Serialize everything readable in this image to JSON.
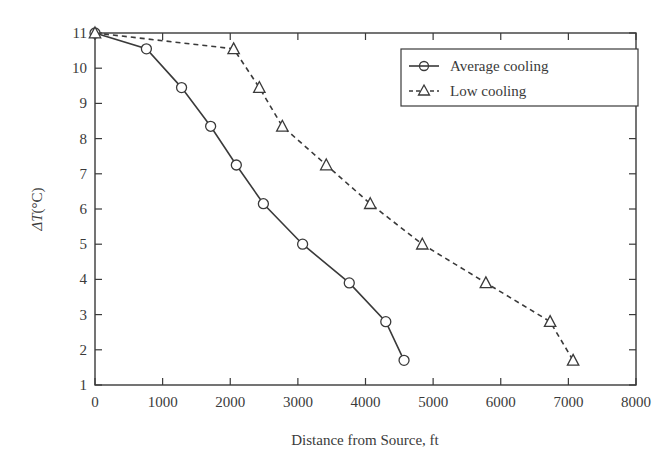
{
  "chart_data": {
    "type": "line",
    "title": "",
    "xlabel": "Distance from Source, ft",
    "ylabel": "ΔT(°C)",
    "xlim": [
      0,
      8000
    ],
    "ylim": [
      1,
      11
    ],
    "xticks": [
      0,
      1000,
      2000,
      3000,
      4000,
      5000,
      6000,
      7000,
      8000
    ],
    "yticks": [
      1,
      2,
      3,
      4,
      5,
      6,
      7,
      8,
      9,
      10,
      11
    ],
    "grid": false,
    "legend_position": "upper right",
    "series": [
      {
        "name": "Average cooling",
        "line_style": "solid",
        "marker": "circle",
        "color": "#3a3a3a",
        "x": [
          0,
          760,
          1280,
          1710,
          2090,
          2490,
          3070,
          3760,
          4300,
          4570
        ],
        "y": [
          11.0,
          10.55,
          9.45,
          8.35,
          7.25,
          6.15,
          5.0,
          3.9,
          2.8,
          1.7
        ]
      },
      {
        "name": "Low cooling",
        "line_style": "dashed",
        "marker": "triangle",
        "color": "#3a3a3a",
        "x": [
          0,
          2050,
          2430,
          2770,
          3420,
          4070,
          4840,
          5780,
          6730,
          7070
        ],
        "y": [
          11.0,
          10.55,
          9.45,
          8.35,
          7.25,
          6.15,
          5.0,
          3.9,
          2.8,
          1.7
        ]
      }
    ]
  },
  "legend": {
    "items": [
      {
        "label": "Average cooling"
      },
      {
        "label": "Low cooling"
      }
    ]
  },
  "axes": {
    "xlabel": "Distance from Source, ft",
    "ylabel_prefix": "Δ",
    "ylabel_var": "T",
    "ylabel_unit": "(°C)"
  }
}
